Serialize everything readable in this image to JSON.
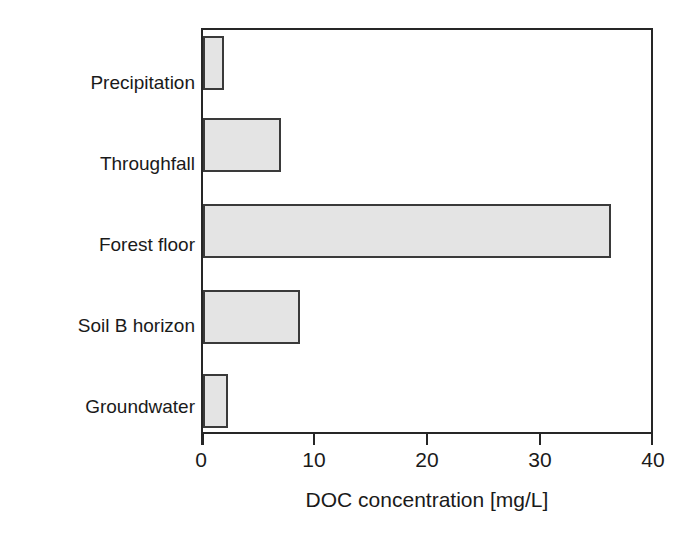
{
  "chart_data": {
    "type": "bar",
    "orientation": "horizontal",
    "title": "",
    "subtitle": "",
    "xlabel": "DOC concentration [mg/L]",
    "ylabel": "",
    "categories": [
      "Precipitation",
      "Throughfall",
      "Forest floor",
      "Soil B horizon",
      "Groundwater"
    ],
    "values": [
      1.9,
      6.9,
      36.1,
      8.6,
      2.2
    ],
    "series": [
      {
        "name": "DOC concentration",
        "values": [
          1.9,
          6.9,
          36.1,
          8.6,
          2.2
        ]
      }
    ],
    "xlim": [
      0,
      40
    ],
    "xticks": [
      0,
      10,
      20,
      30,
      40
    ],
    "xtick_labels": [
      "0",
      "10",
      "20",
      "30",
      "40"
    ],
    "grid": false,
    "legend": false,
    "legend_position": "none",
    "bar_fill_color": "#e4e4e4",
    "bar_border_color": "#3a3a3a",
    "axis_color": "#262626",
    "background_color": "#ffffff",
    "annotations": []
  }
}
